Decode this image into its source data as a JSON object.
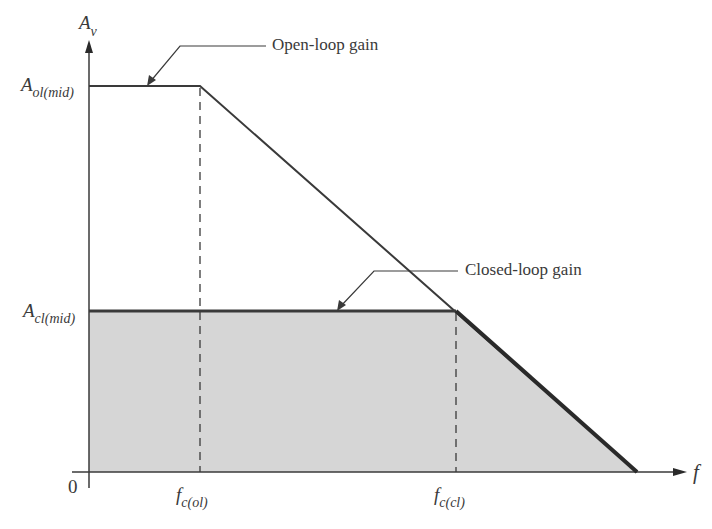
{
  "diagram": {
    "axes": {
      "y_label_main": "A",
      "y_label_sub": "v",
      "x_label": "f",
      "origin_label": "0"
    },
    "y_ticks": [
      {
        "main": "A",
        "sub": "ol(mid)"
      },
      {
        "main": "A",
        "sub": "cl(mid)"
      }
    ],
    "x_ticks": [
      {
        "main": "f",
        "sub": "c(ol)"
      },
      {
        "main": "f",
        "sub": "c(cl)"
      }
    ],
    "annotations": {
      "open_loop": "Open-loop gain",
      "closed_loop": "Closed-loop gain"
    },
    "colors": {
      "line": "#3a3a3a",
      "fill": "#d6d6d6",
      "background": "#ffffff"
    }
  }
}
